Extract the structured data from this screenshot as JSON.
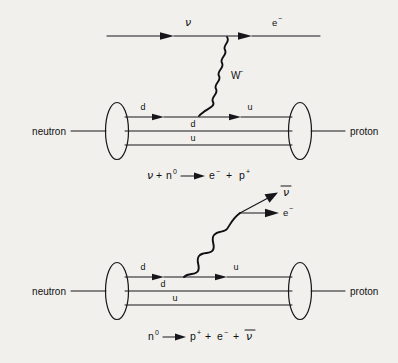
{
  "figure": {
    "background_color": "#f2f0ec",
    "ink_color": "#16161a"
  },
  "diagrams": [
    {
      "id": "neutrino-capture",
      "name": "inverse-beta-decay",
      "incoming_lepton": "ν",
      "outgoing_lepton_symbol": "e",
      "outgoing_lepton_charge": "−",
      "boson_symbol": "W",
      "boson_charge": "−",
      "left_hadron": "neutron",
      "right_hadron": "proton",
      "quark_in_top": "d",
      "quark_out_top": "u",
      "quark_middle": "d",
      "quark_bottom": "u",
      "equation": {
        "lhs_particle_1": "ν",
        "plus_1": "+",
        "lhs_particle_2": "n",
        "lhs_particle_2_sup": "0",
        "arrow": "⟶",
        "rhs_particle_1": "e",
        "rhs_particle_1_sup": "−",
        "plus_2": "+",
        "rhs_particle_2": "p",
        "rhs_particle_2_sup": "+"
      }
    },
    {
      "id": "beta-decay",
      "name": "beta-minus-decay",
      "outgoing_lepton_1": "ν",
      "outgoing_lepton_1_bar": true,
      "outgoing_lepton_2_symbol": "e",
      "outgoing_lepton_2_charge": "−",
      "left_hadron": "neutron",
      "right_hadron": "proton",
      "quark_in_top": "d",
      "quark_out_top": "u",
      "quark_middle": "d",
      "quark_bottom": "u",
      "equation": {
        "lhs_particle": "n",
        "lhs_particle_sup": "0",
        "arrow": "⟶",
        "rhs_particle_1": "p",
        "rhs_particle_1_sup": "+",
        "plus_1": "+",
        "rhs_particle_2": "e",
        "rhs_particle_2_sup": "−",
        "plus_2": "+",
        "rhs_particle_3": "ν"
      }
    }
  ]
}
